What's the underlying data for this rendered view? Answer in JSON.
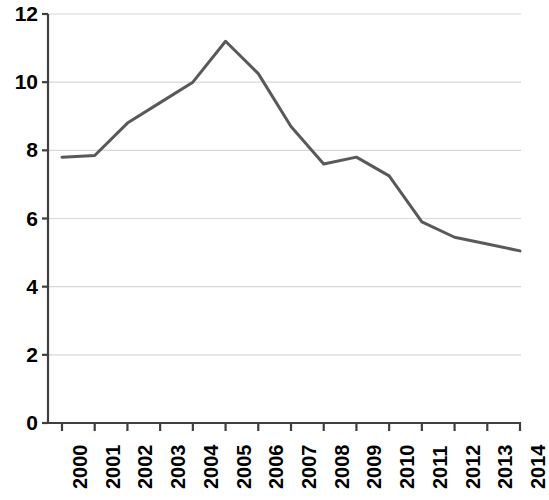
{
  "chart_data": {
    "type": "line",
    "title": "",
    "subtitle": "",
    "xlabel": "",
    "ylabel": "",
    "categories": [
      "2000",
      "2001",
      "2002",
      "2003",
      "2004",
      "2005",
      "2006",
      "2007",
      "2008",
      "2009",
      "2010",
      "2011",
      "2012",
      "2013",
      "2014"
    ],
    "x": [
      2000,
      2001,
      2002,
      2003,
      2004,
      2005,
      2006,
      2007,
      2008,
      2009,
      2010,
      2011,
      2012,
      2013,
      2014
    ],
    "values": [
      7.8,
      7.85,
      8.8,
      9.4,
      10.0,
      11.2,
      10.25,
      8.7,
      7.6,
      7.8,
      7.25,
      5.9,
      5.45,
      5.25,
      5.05
    ],
    "series": [
      {
        "name": "",
        "values": [
          7.8,
          7.85,
          8.8,
          9.4,
          10.0,
          11.2,
          10.25,
          8.7,
          7.6,
          7.8,
          7.25,
          5.9,
          5.45,
          5.25,
          5.05
        ]
      }
    ],
    "ylim": [
      0,
      12
    ],
    "yticks": [
      0,
      2,
      4,
      6,
      8,
      10,
      12
    ],
    "ytick_labels": [
      "0",
      "2",
      "4",
      "6",
      "8",
      "10",
      "12"
    ],
    "xtick_labels": [
      "2000",
      "2001",
      "2002",
      "2003",
      "2004",
      "2005",
      "2006",
      "2007",
      "2008",
      "2009",
      "2010",
      "2011",
      "2012",
      "2013",
      "2014"
    ],
    "grid": true,
    "grid_axis": "y",
    "legend": false,
    "legend_position": "none",
    "annotations": [],
    "colors": {
      "line": "#58595b",
      "gridline": "#d8d8d8",
      "axis": "#3f3f3f",
      "text": "#000000",
      "background": "#ffffff"
    }
  }
}
